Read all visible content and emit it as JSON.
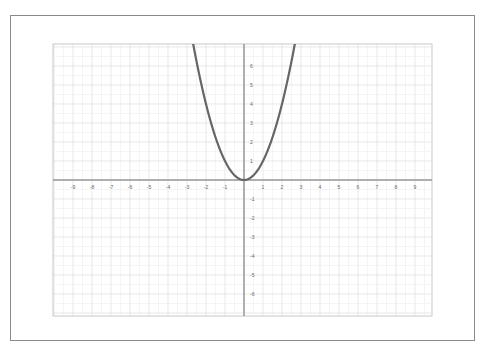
{
  "chart_data": {
    "type": "line",
    "title": "",
    "xlabel": "",
    "ylabel": "",
    "function": "y = x^2",
    "xlim": [
      -10,
      10
    ],
    "ylim": [
      -7,
      7
    ],
    "grid": true,
    "legend": null,
    "x_ticks": [
      -9,
      -8,
      -7,
      -6,
      -5,
      -4,
      -3,
      -2,
      -1,
      1,
      2,
      3,
      4,
      5,
      6,
      7,
      8,
      9
    ],
    "y_ticks": [
      6,
      5,
      4,
      3,
      2,
      1,
      -1,
      -2,
      -3,
      -4,
      -5,
      -6
    ],
    "series": [
      {
        "name": "y = x^2",
        "x": [
          -2.65,
          -2.5,
          -2,
          -1.5,
          -1,
          -0.5,
          0,
          0.5,
          1,
          1.5,
          2,
          2.5,
          2.65
        ],
        "y": [
          7.02,
          6.25,
          4,
          2.25,
          1,
          0.25,
          0,
          0.25,
          1,
          2.25,
          4,
          6.25,
          7.02
        ],
        "color": "#666666"
      }
    ]
  },
  "colors": {
    "axis": "#999999",
    "grid": "#d8d8d8",
    "curve": "#666666",
    "frame": "#8a8a8a"
  }
}
